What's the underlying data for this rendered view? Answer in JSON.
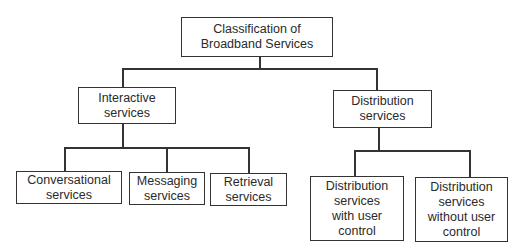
{
  "diagram": {
    "type": "hierarchy",
    "root": {
      "lines": [
        "Classification of",
        "Broadband Services"
      ]
    },
    "level1": [
      {
        "lines": [
          "Interactive",
          "services"
        ],
        "children": [
          {
            "lines": [
              "Conversational",
              "services"
            ]
          },
          {
            "lines": [
              "Messaging",
              "services"
            ]
          },
          {
            "lines": [
              "Retrieval",
              "services"
            ]
          }
        ]
      },
      {
        "lines": [
          "Distribution",
          "services"
        ],
        "children": [
          {
            "lines": [
              "Distribution",
              "services",
              "with user",
              "control"
            ]
          },
          {
            "lines": [
              "Distribution",
              "services",
              "without user",
              "control"
            ]
          }
        ]
      }
    ],
    "colors": {
      "line": "#333333",
      "text": "#2a2a2a",
      "background": "#ffffff"
    }
  }
}
